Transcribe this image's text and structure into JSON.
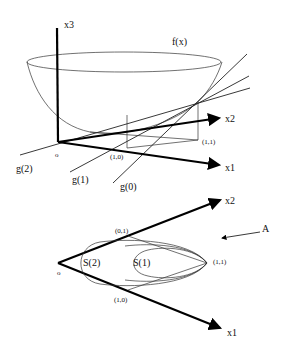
{
  "top_figure": {
    "axes": {
      "x1": "x1",
      "x2": "x2",
      "x3": "x3"
    },
    "origin_label": "o",
    "function_label": "f(x)",
    "points": {
      "p10": "(1,0)",
      "p11": "(1,1)"
    },
    "tangent_lines": [
      {
        "label": "g(0)"
      },
      {
        "label": "g(1)"
      },
      {
        "label": "g(2)"
      }
    ]
  },
  "bottom_figure": {
    "axes": {
      "x1": "x1",
      "x2": "x2"
    },
    "origin_label": "o",
    "points": {
      "p01": "(0,1)",
      "p10": "(1,0)",
      "p11": "(1,1)"
    },
    "sets": [
      {
        "label": "S(1)"
      },
      {
        "label": "S(2)"
      }
    ],
    "arrow_label": "A"
  }
}
